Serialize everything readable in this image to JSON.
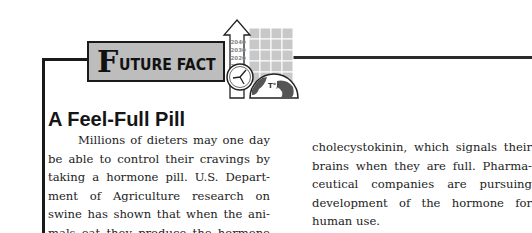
{
  "banner": {
    "initial": "F",
    "rest": "UTURE FACT"
  },
  "icon": {
    "years": [
      "2040",
      "2030",
      "2020",
      "2010"
    ]
  },
  "article": {
    "title": "A Feel-Full Pill",
    "column1_lines": [
      "Millions of dieters may one day",
      "be able to control their cravings by",
      "taking a hormone pill. U.S. Depart-",
      "ment of Agriculture research on",
      "swine has shown that when the ani-",
      "mals eat they produce the hormone"
    ],
    "column2_lines": [
      "cholecystokinin, which signals their",
      "brains when they are full. Pharma-",
      "ceutical companies are pursuing",
      "development of the hormone for",
      "human use."
    ]
  }
}
